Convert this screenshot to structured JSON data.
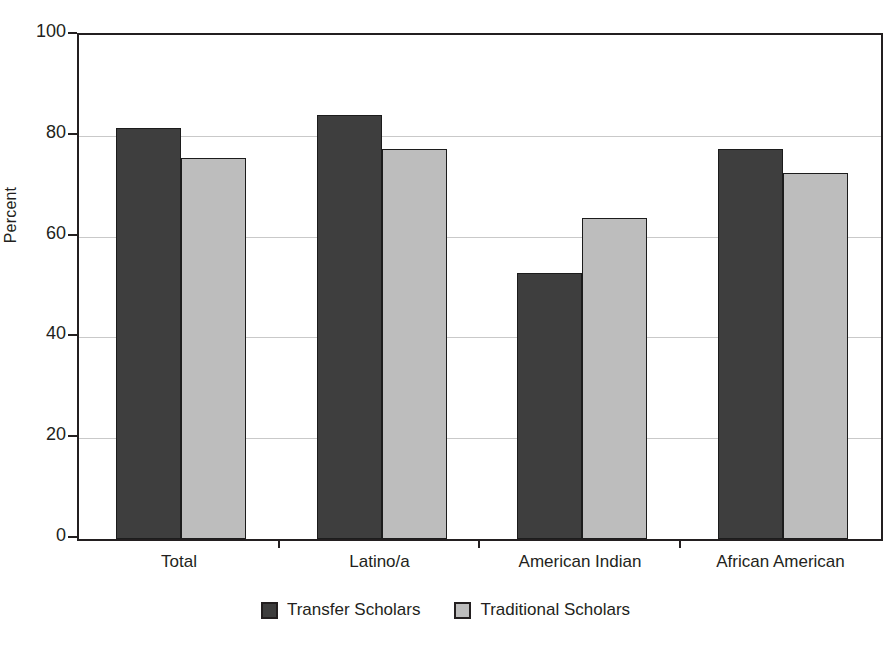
{
  "chart_data": {
    "type": "bar",
    "title": "",
    "xlabel": "",
    "ylabel": "Percent",
    "ylim": [
      0,
      100
    ],
    "yticks": [
      0,
      20,
      40,
      60,
      80,
      100
    ],
    "ytick_labels": [
      "0",
      "20",
      "40",
      "60",
      "80",
      "100"
    ],
    "grid": true,
    "legend_position": "bottom-center",
    "categories": [
      "Total",
      "Latino/a",
      "American Indian",
      "African American"
    ],
    "series": [
      {
        "name": "Transfer Scholars",
        "color": "#3e3e3e",
        "values": [
          81.5,
          84.2,
          52.7,
          77.3
        ]
      },
      {
        "name": "Traditional Scholars",
        "color": "#bdbdbd",
        "values": [
          75.6,
          77.4,
          63.7,
          72.6
        ]
      }
    ]
  },
  "legend": {
    "items": [
      {
        "label": "Transfer Scholars",
        "swatch": "dark"
      },
      {
        "label": "Traditional Scholars",
        "swatch": "light"
      }
    ]
  },
  "colors": {
    "transfer": "#3e3e3e",
    "traditional": "#bdbdbd",
    "axis": "#231f20",
    "gridline": "#c9c9c9",
    "background": "#ffffff"
  }
}
